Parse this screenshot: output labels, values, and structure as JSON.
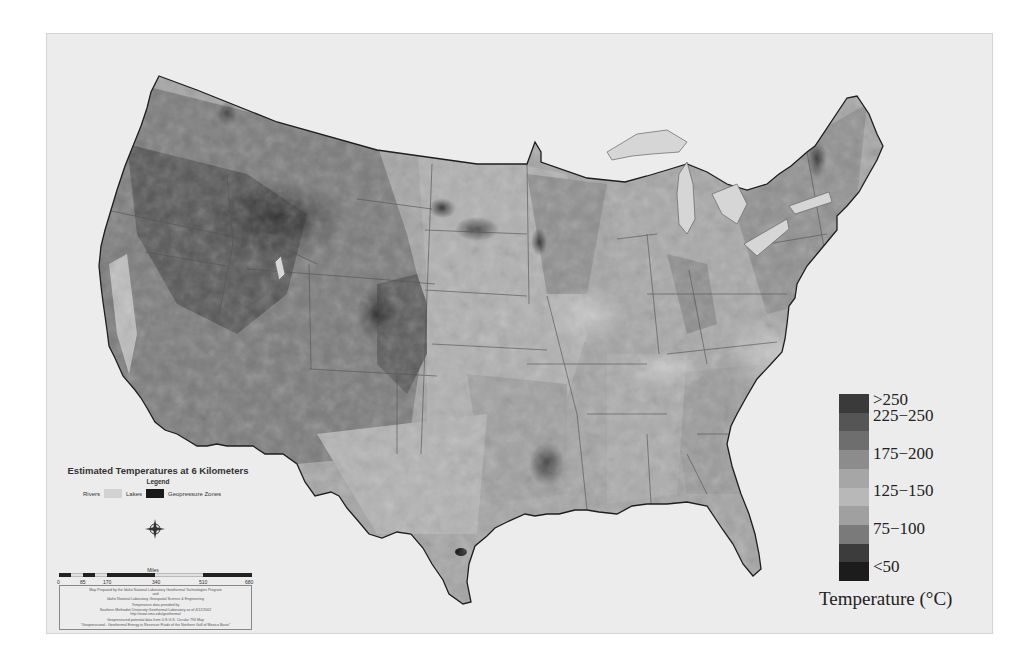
{
  "map": {
    "title": "Estimated Temperatures at 6 Kilometers",
    "legend_heading": "Legend",
    "legend_keys": [
      {
        "label": "Rivers",
        "color": "#f4f4f4"
      },
      {
        "label": "Lakes",
        "color": "#d2d2d2"
      },
      {
        "label": "Geopressure Zones",
        "color": "#1a1a1a"
      }
    ],
    "compass": {
      "n": "N",
      "s": "S",
      "e": "E",
      "w": "W"
    },
    "scale": {
      "unit": "Miles",
      "ticks": [
        "0",
        "85",
        "170",
        "340",
        "510",
        "680"
      ]
    },
    "credits": [
      "Map Prepared by the Idaho National Laboratory Geothermal Technologies Program",
      "and",
      "Idaho National Laboratory Geospatial Science & Engineering",
      "",
      "Temperature data provided by",
      "Southern Methodist University Geothermal Laboratory as of 4/12/2002",
      "http://www.smu.edu/geothermal",
      "",
      "Geopressured potential data from U.S.G.S. Circular 790 Map",
      "\"Geopressured - Geothermal Energy in Reservoir Fluids of the Northern Gulf of Mexico Basin\""
    ]
  },
  "temperature_legend": {
    "title": "Temperature (°C)",
    "labels": [
      ">250",
      "225−250",
      "175−200",
      "125−150",
      "75−100",
      "<50"
    ],
    "colors": [
      "#3a3a3a",
      "#555555",
      "#6e6e6e",
      "#8c8c8c",
      "#a6a6a6",
      "#b8b8b8",
      "#a0a0a0",
      "#7a7a7a",
      "#3c3c3c",
      "#1c1c1c"
    ]
  }
}
